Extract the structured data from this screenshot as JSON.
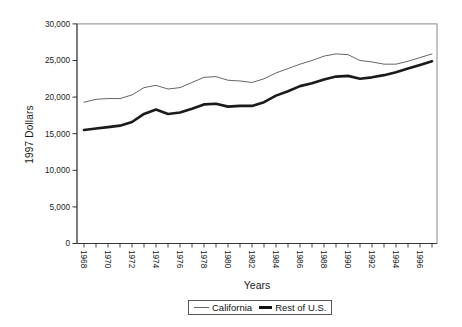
{
  "chart_data": {
    "type": "line",
    "title": "",
    "xlabel": "Years",
    "ylabel": "1997 Dollars",
    "x": [
      1968,
      1969,
      1970,
      1971,
      1972,
      1973,
      1974,
      1975,
      1976,
      1977,
      1978,
      1979,
      1980,
      1981,
      1982,
      1983,
      1984,
      1985,
      1986,
      1987,
      1988,
      1989,
      1990,
      1991,
      1992,
      1993,
      1994,
      1995,
      1996,
      1997
    ],
    "x_tick_labels": [
      "1968",
      "1970",
      "1972",
      "1974",
      "1976",
      "1978",
      "1980",
      "1982",
      "1984",
      "1986",
      "1988",
      "1990",
      "1992",
      "1994",
      "1996"
    ],
    "ylim": [
      0,
      30000
    ],
    "yticks": [
      0,
      5000,
      10000,
      15000,
      20000,
      25000,
      30000
    ],
    "grid": false,
    "legend_position": "bottom-center",
    "series": [
      {
        "name": "California",
        "color": "#666666",
        "width": 1,
        "values": [
          19300,
          19700,
          19800,
          19800,
          20300,
          21300,
          21600,
          21100,
          21300,
          22000,
          22700,
          22800,
          22300,
          22200,
          22000,
          22500,
          23300,
          23900,
          24500,
          25000,
          25600,
          25900,
          25800,
          25000,
          24800,
          24500,
          24500,
          24900,
          25400,
          25900
        ]
      },
      {
        "name": "Rest of U.S.",
        "color": "#1a1a1a",
        "width": 2.6,
        "values": [
          15500,
          15700,
          15900,
          16100,
          16600,
          17700,
          18300,
          17700,
          17900,
          18400,
          19000,
          19100,
          18700,
          18800,
          18800,
          19300,
          20200,
          20800,
          21500,
          21900,
          22400,
          22800,
          22900,
          22500,
          22700,
          23000,
          23400,
          23900,
          24400,
          24900
        ]
      }
    ]
  }
}
